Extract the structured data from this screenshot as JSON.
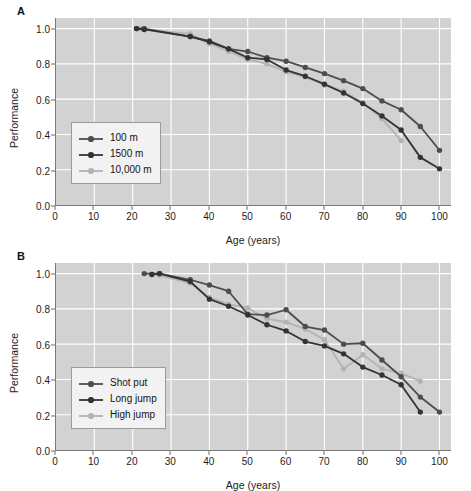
{
  "figure": {
    "panels": [
      {
        "label": "A",
        "xlabel": "Age (years)",
        "ylabel": "Performance",
        "xticks": [
          "0",
          "10",
          "20",
          "30",
          "40",
          "50",
          "60",
          "70",
          "80",
          "90",
          "100"
        ],
        "yticks": [
          "0.0",
          "0.2",
          "0.4",
          "0.6",
          "0.8",
          "1.0"
        ],
        "legend": [
          "100 m",
          "1500 m",
          "10,000 m"
        ]
      },
      {
        "label": "B",
        "xlabel": "Age (years)",
        "ylabel": "Performance",
        "xticks": [
          "0",
          "10",
          "20",
          "30",
          "40",
          "50",
          "60",
          "70",
          "80",
          "90",
          "100"
        ],
        "yticks": [
          "0.0",
          "0.2",
          "0.4",
          "0.6",
          "0.8",
          "1.0"
        ],
        "legend": [
          "Shot put",
          "Long jump",
          "High jump"
        ]
      }
    ]
  },
  "chart_data": [
    {
      "type": "line",
      "panel": "A",
      "title": "",
      "xlabel": "Age (years)",
      "ylabel": "Performance",
      "xlim": [
        0,
        103
      ],
      "ylim": [
        0.0,
        1.06
      ],
      "xticks": [
        0,
        10,
        20,
        30,
        40,
        50,
        60,
        70,
        80,
        90,
        100
      ],
      "yticks": [
        0.0,
        0.2,
        0.4,
        0.6,
        0.8,
        1.0
      ],
      "grid": true,
      "legend_position": "lower-left",
      "colors": {
        "100 m": "#4d4d4d",
        "1500 m": "#333333",
        "10,000 m": "#b3b3b3"
      },
      "series": [
        {
          "name": "100 m",
          "color": "#4d4d4d",
          "x": [
            21,
            23,
            35,
            40,
            45,
            50,
            55,
            60,
            65,
            70,
            75,
            80,
            85,
            90,
            95,
            100
          ],
          "y": [
            1.0,
            1.0,
            0.955,
            0.93,
            0.885,
            0.87,
            0.835,
            0.815,
            0.78,
            0.745,
            0.705,
            0.66,
            0.59,
            0.54,
            0.445,
            0.31
          ]
        },
        {
          "name": "1500 m",
          "color": "#333333",
          "x": [
            21,
            23,
            35,
            40,
            45,
            50,
            55,
            60,
            65,
            70,
            75,
            80,
            85,
            90,
            95,
            100
          ],
          "y": [
            1.0,
            0.995,
            0.955,
            0.925,
            0.885,
            0.835,
            0.825,
            0.765,
            0.73,
            0.685,
            0.635,
            0.575,
            0.505,
            0.425,
            0.27,
            0.205
          ]
        },
        {
          "name": "10,000 m",
          "color": "#b3b3b3",
          "x": [
            22,
            23,
            35,
            40,
            45,
            50,
            55,
            60,
            65,
            70,
            75,
            80,
            85,
            90
          ],
          "y": [
            1.0,
            0.995,
            0.97,
            0.915,
            0.87,
            0.825,
            0.8,
            0.755,
            0.725,
            0.68,
            0.645,
            0.58,
            0.49,
            0.365
          ]
        }
      ]
    },
    {
      "type": "line",
      "panel": "B",
      "title": "",
      "xlabel": "Age (years)",
      "ylabel": "Performance",
      "xlim": [
        0,
        103
      ],
      "ylim": [
        0.0,
        1.06
      ],
      "xticks": [
        0,
        10,
        20,
        30,
        40,
        50,
        60,
        70,
        80,
        90,
        100
      ],
      "yticks": [
        0.0,
        0.2,
        0.4,
        0.6,
        0.8,
        1.0
      ],
      "grid": true,
      "legend_position": "lower-left",
      "colors": {
        "Shot put": "#4d4d4d",
        "Long jump": "#333333",
        "High jump": "#b3b3b3"
      },
      "series": [
        {
          "name": "Shot put",
          "color": "#4d4d4d",
          "x": [
            23,
            27,
            35,
            40,
            45,
            50,
            55,
            60,
            65,
            70,
            75,
            80,
            85,
            90,
            95,
            100
          ],
          "y": [
            1.0,
            1.0,
            0.965,
            0.935,
            0.9,
            0.77,
            0.765,
            0.795,
            0.7,
            0.68,
            0.6,
            0.605,
            0.51,
            0.415,
            0.3,
            0.215
          ]
        },
        {
          "name": "Long jump",
          "color": "#333333",
          "x": [
            25,
            27,
            35,
            40,
            45,
            50,
            55,
            60,
            65,
            70,
            75,
            80,
            85,
            90,
            95
          ],
          "y": [
            0.995,
            1.0,
            0.955,
            0.855,
            0.815,
            0.765,
            0.71,
            0.675,
            0.615,
            0.59,
            0.545,
            0.47,
            0.425,
            0.37,
            0.215
          ]
        },
        {
          "name": "High jump",
          "color": "#b3b3b3",
          "x": [
            25,
            27,
            35,
            40,
            45,
            50,
            55,
            60,
            65,
            70,
            75,
            80,
            85,
            90,
            95
          ],
          "y": [
            0.995,
            0.99,
            0.945,
            0.865,
            0.825,
            0.805,
            0.745,
            0.725,
            0.685,
            0.625,
            0.46,
            0.54,
            0.46,
            0.435,
            0.39
          ]
        }
      ]
    }
  ]
}
